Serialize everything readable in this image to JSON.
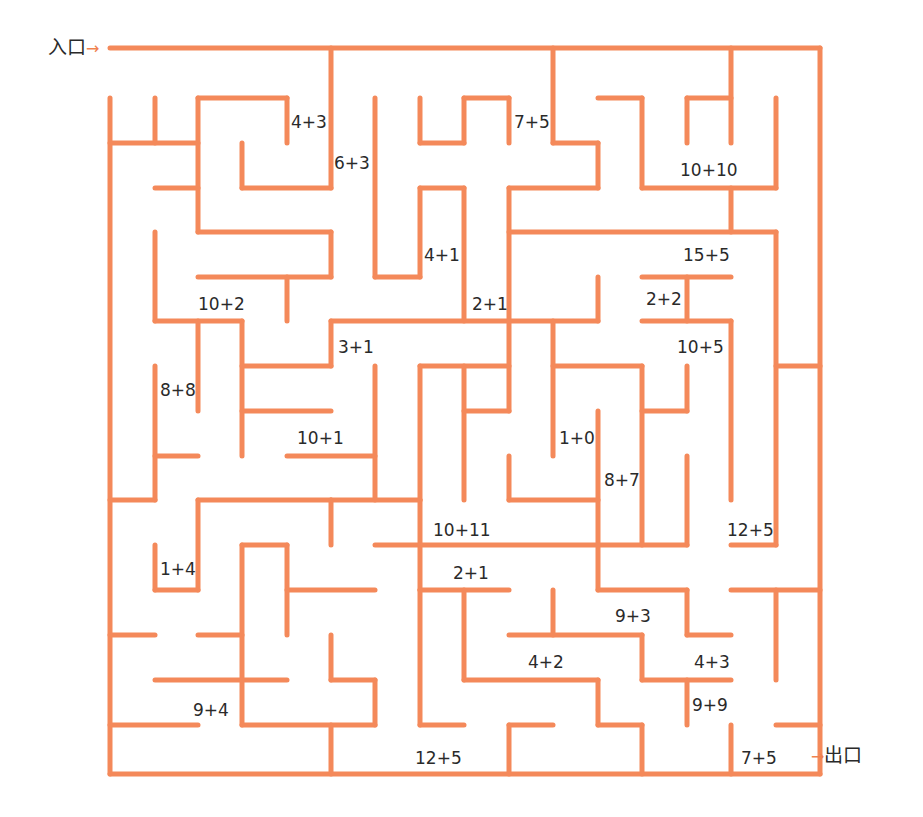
{
  "wall_color": "#f4895a",
  "entrance": {
    "label": "入口",
    "arrow": "→"
  },
  "exit": {
    "label": "出口",
    "arrow": "→"
  },
  "problems": [
    {
      "text": "4+3",
      "x": 291,
      "y": 114
    },
    {
      "text": "6+3",
      "x": 334,
      "y": 155
    },
    {
      "text": "7+5",
      "x": 514,
      "y": 114
    },
    {
      "text": "10+10",
      "x": 680,
      "y": 162
    },
    {
      "text": "4+1",
      "x": 424,
      "y": 247
    },
    {
      "text": "15+5",
      "x": 683,
      "y": 247
    },
    {
      "text": "10+2",
      "x": 198,
      "y": 296
    },
    {
      "text": "2+1",
      "x": 472,
      "y": 296
    },
    {
      "text": "2+2",
      "x": 646,
      "y": 291
    },
    {
      "text": "3+1",
      "x": 338,
      "y": 339
    },
    {
      "text": "10+5",
      "x": 677,
      "y": 339
    },
    {
      "text": "8+8",
      "x": 160,
      "y": 382
    },
    {
      "text": "10+1",
      "x": 297,
      "y": 430
    },
    {
      "text": "1+0",
      "x": 559,
      "y": 430
    },
    {
      "text": "8+7",
      "x": 604,
      "y": 472
    },
    {
      "text": "10+11",
      "x": 433,
      "y": 522
    },
    {
      "text": "12+5",
      "x": 727,
      "y": 522
    },
    {
      "text": "1+4",
      "x": 160,
      "y": 561
    },
    {
      "text": "2+1",
      "x": 453,
      "y": 565
    },
    {
      "text": "9+3",
      "x": 615,
      "y": 608
    },
    {
      "text": "4+2",
      "x": 528,
      "y": 654
    },
    {
      "text": "4+3",
      "x": 694,
      "y": 654
    },
    {
      "text": "9+4",
      "x": 193,
      "y": 702
    },
    {
      "text": "9+9",
      "x": 692,
      "y": 697
    },
    {
      "text": "12+5",
      "x": 415,
      "y": 750
    },
    {
      "text": "7+5",
      "x": 741,
      "y": 750
    }
  ]
}
